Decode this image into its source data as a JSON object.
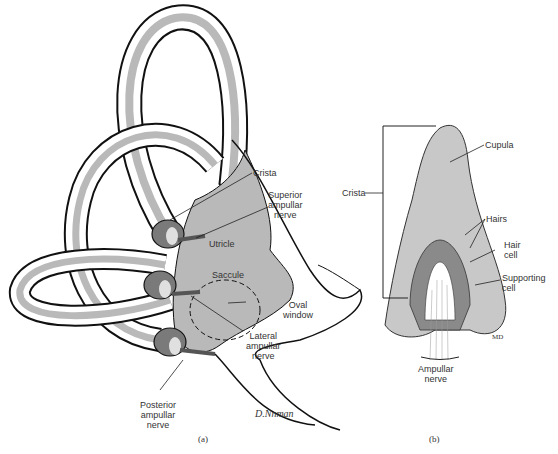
{
  "panel_a": {
    "caption": "(a)",
    "labels": {
      "crista": "Crista",
      "superior_ampullar_nerve": [
        "Superior",
        "ampullar",
        "nerve"
      ],
      "utricle": "Utricle",
      "saccule": "Saccule",
      "oval_window": [
        "Oval",
        "window"
      ],
      "lateral_ampullar_nerve": [
        "Lateral",
        "ampullar",
        "nerve"
      ],
      "posterior_ampullar_nerve": [
        "Posterior",
        "ampullar",
        "nerve"
      ]
    },
    "signature": "D.Nnman"
  },
  "panel_b": {
    "caption": "(b)",
    "labels": {
      "crista": "Crista",
      "cupula": "Cupula",
      "hairs": "Hairs",
      "hair_cell": [
        "Hair",
        "cell"
      ],
      "supporting_cell": [
        "Supporting",
        "cell"
      ],
      "ampullar_nerve": [
        "Ampullar",
        "nerve"
      ]
    },
    "initials": "MD"
  },
  "colors": {
    "membrane_gray": "#b9b9b9",
    "ampulla_dark": "#7a7a7a",
    "outline": "#111111",
    "cupula_gray": "#c8c8c8"
  }
}
